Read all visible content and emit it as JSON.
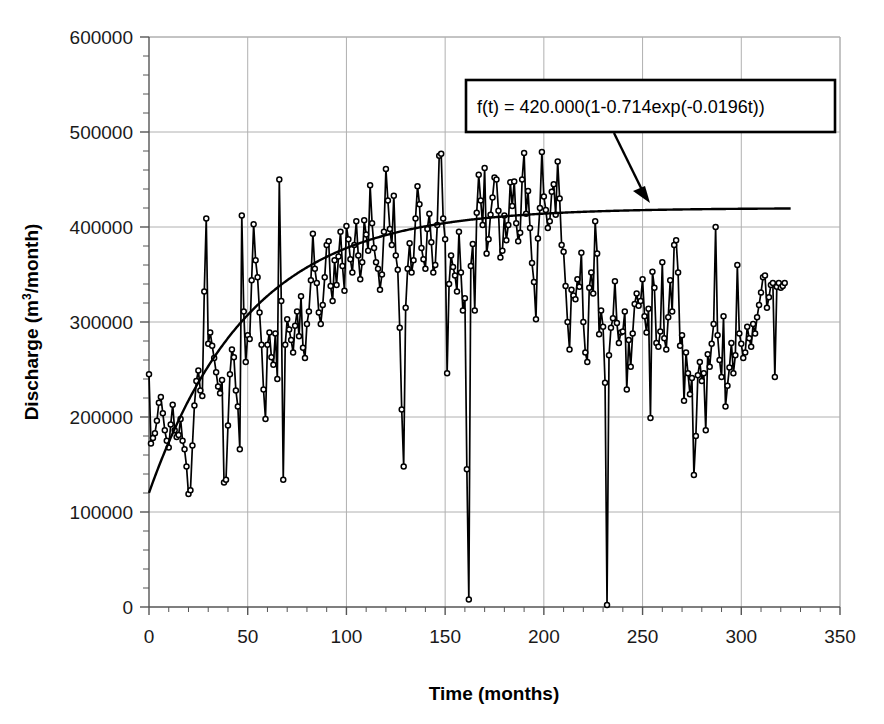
{
  "chart_data": {
    "type": "line",
    "title": "",
    "xlabel": "Time (months)",
    "ylabel": "Discharge (m³/month)",
    "ylabel_main": "Discharge (m",
    "ylabel_sup": "3",
    "ylabel_tail": "/month)",
    "xlim": [
      0,
      350
    ],
    "ylim": [
      0,
      600000
    ],
    "xticks": [
      0,
      50,
      100,
      150,
      200,
      250,
      300,
      350
    ],
    "xtick_labels": [
      "0",
      "50",
      "100",
      "150",
      "200",
      "250",
      "300",
      "350"
    ],
    "yticks": [
      0,
      100000,
      200000,
      300000,
      400000,
      500000,
      600000
    ],
    "ytick_labels": [
      "0",
      "100000",
      "200000",
      "300000",
      "400000",
      "500000",
      "600000"
    ],
    "x_minor_step": 10,
    "y_minor_step": 20000,
    "grid": true,
    "grid_color": "#b0b0b0",
    "legend_position": "none",
    "series": [
      {
        "name": "Monthly discharge",
        "style": "line-markers",
        "color": "#000000",
        "marker": "open-circle",
        "x_start": 0,
        "x_step": 1,
        "values": [
          245000,
          172000,
          178000,
          183000,
          196000,
          215000,
          221000,
          204000,
          186000,
          175000,
          168000,
          192000,
          213000,
          186000,
          179000,
          181000,
          198000,
          175000,
          166000,
          148000,
          119000,
          123000,
          170000,
          212000,
          238000,
          249000,
          228000,
          222000,
          332000,
          409000,
          277000,
          289000,
          275000,
          262000,
          247000,
          232000,
          225000,
          239000,
          131000,
          134000,
          191000,
          245000,
          271000,
          263000,
          228000,
          211000,
          166000,
          412000,
          311000,
          258000,
          286000,
          282000,
          344000,
          403000,
          365000,
          347000,
          310000,
          276000,
          229000,
          198000,
          276000,
          289000,
          263000,
          255000,
          288000,
          240000,
          450000,
          322000,
          134000,
          276000,
          303000,
          292000,
          281000,
          268000,
          296000,
          311000,
          285000,
          327000,
          273000,
          262000,
          298000,
          311000,
          344000,
          393000,
          356000,
          341000,
          310000,
          298000,
          318000,
          347000,
          381000,
          385000,
          338000,
          322000,
          365000,
          339000,
          369000,
          395000,
          359000,
          333000,
          401000,
          387000,
          366000,
          352000,
          381000,
          406000,
          370000,
          345000,
          363000,
          407000,
          392000,
          375000,
          444000,
          404000,
          378000,
          363000,
          356000,
          334000,
          350000,
          395000,
          461000,
          428000,
          398000,
          381000,
          433000,
          370000,
          355000,
          294000,
          208000,
          148000,
          315000,
          356000,
          383000,
          352000,
          365000,
          409000,
          443000,
          424000,
          378000,
          366000,
          356000,
          398000,
          414000,
          384000,
          352000,
          360000,
          402000,
          475000,
          477000,
          409000,
          387000,
          246000,
          340000,
          370000,
          358000,
          349000,
          332000,
          395000,
          352000,
          312000,
          325000,
          145000,
          8000,
          359000,
          382000,
          312000,
          415000,
          455000,
          428000,
          402000,
          462000,
          372000,
          387000,
          413000,
          431000,
          452000,
          450000,
          417000,
          368000,
          375000,
          412000,
          386000,
          402000,
          447000,
          422000,
          448000,
          404000,
          385000,
          394000,
          450000,
          478000,
          414000,
          438000,
          399000,
          362000,
          342000,
          303000,
          388000,
          420000,
          479000,
          432000,
          418000,
          399000,
          406000,
          437000,
          445000,
          413000,
          469000,
          430000,
          381000,
          374000,
          338000,
          300000,
          271000,
          334000,
          328000,
          324000,
          345000,
          337000,
          373000,
          300000,
          268000,
          258000,
          336000,
          352000,
          330000,
          406000,
          372000,
          287000,
          312000,
          295000,
          236000,
          2000,
          265000,
          294000,
          304000,
          343000,
          299000,
          278000,
          289000,
          290000,
          311000,
          229000,
          281000,
          253000,
          288000,
          319000,
          330000,
          317000,
          322000,
          345000,
          306000,
          289000,
          314000,
          199000,
          353000,
          336000,
          278000,
          274000,
          290000,
          363000,
          283000,
          271000,
          305000,
          344000,
          311000,
          381000,
          386000,
          352000,
          275000,
          286000,
          217000,
          268000,
          246000,
          224000,
          241000,
          139000,
          180000,
          244000,
          258000,
          238000,
          246000,
          186000,
          266000,
          253000,
          277000,
          298000,
          400000,
          286000,
          260000,
          242000,
          306000,
          211000,
          233000,
          252000,
          278000,
          246000,
          265000,
          360000,
          288000,
          277000,
          262000,
          268000,
          295000,
          283000,
          274000,
          298000,
          288000,
          305000,
          318000,
          331000,
          347000,
          349000,
          315000,
          326000,
          339000,
          341000,
          242000,
          337000,
          341000,
          336000,
          338000,
          341000
        ]
      },
      {
        "name": "Fitted exponential curve",
        "style": "smooth-line",
        "color": "#000000",
        "equation": "f(t) = 420.000(1-0.714exp(-0.0196t))",
        "params": {
          "A": 420000,
          "B": 0.714,
          "k": 0.0196
        },
        "x_range": [
          0,
          325
        ]
      }
    ],
    "annotations": [
      {
        "name": "equation-box",
        "text": "f(t) = 420.000(1-0.714exp(-0.0196t))",
        "box": {
          "x": 466,
          "y": 80,
          "width": 369,
          "height": 52
        },
        "arrow_from": {
          "x": 614,
          "y": 133
        },
        "arrow_to": {
          "x": 650,
          "y": 203
        }
      }
    ]
  }
}
